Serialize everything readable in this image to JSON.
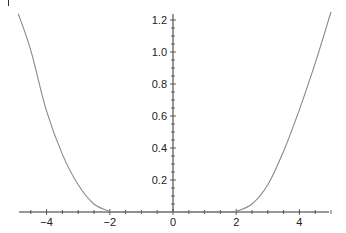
{
  "chart_data": {
    "type": "line",
    "title": "",
    "xlabel": "",
    "ylabel": "",
    "xlim": [
      -4.9,
      5.0
    ],
    "ylim": [
      0,
      1.25
    ],
    "grid": false,
    "legend": null,
    "x_ticks": [
      -4,
      -2,
      0,
      2,
      4
    ],
    "x_tick_labels": [
      "−4",
      "−2",
      "0",
      "2",
      "4"
    ],
    "y_ticks": [
      0.2,
      0.4,
      0.6,
      0.8,
      1.0,
      1.2
    ],
    "y_tick_labels": [
      "0.2",
      "0.4",
      "0.6",
      "0.8",
      "1.0",
      "1.2"
    ],
    "series": [
      {
        "name": "curve",
        "color": "#888888",
        "x": [
          -4.9,
          -4.5,
          -4.0,
          -3.5,
          -3.0,
          -2.5,
          -2.0,
          -1.8,
          0.0,
          1.8,
          2.0,
          2.5,
          3.0,
          3.5,
          4.0,
          4.5,
          5.0
        ],
        "y": [
          1.24,
          1.01,
          0.63,
          0.36,
          0.17,
          0.05,
          0.005,
          0.0,
          0.0,
          0.0,
          0.005,
          0.05,
          0.17,
          0.38,
          0.64,
          0.93,
          1.25
        ]
      }
    ]
  },
  "axes": {
    "axis_color": "#333333",
    "curve_color": "#888888"
  }
}
